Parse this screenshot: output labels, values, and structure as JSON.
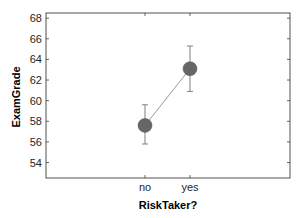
{
  "chart_data": {
    "type": "line",
    "title": "",
    "xlabel": "RiskTaker?",
    "ylabel": "ExamGrade",
    "categories": [
      "no",
      "yes"
    ],
    "series": [
      {
        "name": "ExamGrade",
        "values": [
          57.6,
          63.1
        ],
        "error_low": [
          55.8,
          60.9
        ],
        "error_high": [
          59.6,
          65.3
        ]
      }
    ],
    "ylim": [
      52.5,
      68.5
    ],
    "yticks": [
      54,
      56,
      58,
      60,
      62,
      64,
      66,
      68
    ],
    "grid": false,
    "legend": null,
    "colors": {
      "marker": "#666666",
      "line": "#999999",
      "errorbar": "#808080",
      "axes": "#262626"
    }
  }
}
